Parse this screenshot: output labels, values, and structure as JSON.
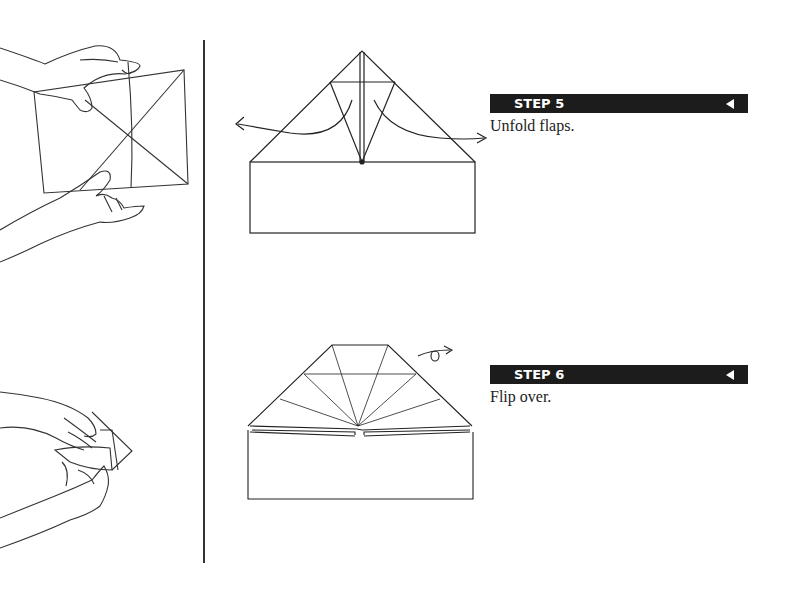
{
  "steps": [
    {
      "label": "STEP 5",
      "instruction": "Unfold flaps.",
      "arrow_icon": "left-triangle-icon"
    },
    {
      "label": "STEP 6",
      "instruction": "Flip over.",
      "arrow_icon": "left-triangle-icon"
    }
  ],
  "illustrations": {
    "left_top": "hands-folding-square-paper",
    "left_bottom": "hands-folding-paper-hat",
    "diagram_step5": "paper-hat-unfold-flaps-diagram",
    "diagram_step6": "paper-hat-flip-over-diagram"
  },
  "colors": {
    "bar": "#1c1c1c",
    "ink": "#222222",
    "background": "#ffffff"
  }
}
